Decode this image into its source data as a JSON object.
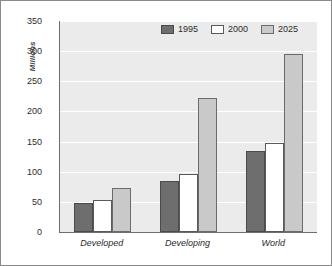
{
  "chart_data": {
    "type": "bar",
    "title": "",
    "subtitle": "",
    "xlabel": "",
    "ylabel": "Millions",
    "ylim": [
      0,
      350
    ],
    "ytick_values": [
      0,
      50,
      100,
      150,
      200,
      250,
      300,
      350
    ],
    "ytick_labels": [
      "0",
      "50",
      "100",
      "150",
      "200",
      "250",
      "300",
      "350"
    ],
    "grid": "horizontal",
    "legend_position": "top-center",
    "categories": [
      "Developed",
      "Developing",
      "World"
    ],
    "series": [
      {
        "name": "1995",
        "color": "#6e6e6e",
        "values": [
          48,
          85,
          135
        ]
      },
      {
        "name": "2000",
        "color": "#ffffff",
        "values": [
          53,
          97,
          148
        ]
      },
      {
        "name": "2025",
        "color": "#c9c9c9",
        "values": [
          73,
          222,
          295
        ]
      }
    ]
  },
  "legend": {
    "items": [
      {
        "label": "1995"
      },
      {
        "label": "2000"
      },
      {
        "label": "2025"
      }
    ]
  }
}
